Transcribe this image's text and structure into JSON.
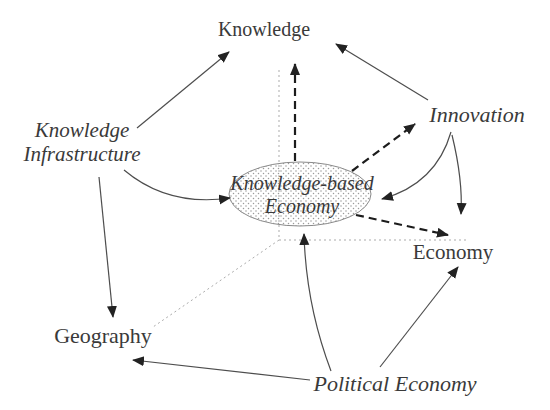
{
  "diagram": {
    "colors": {
      "background": "#ffffff",
      "text": "#3a3a3a",
      "solid_line": "#4d4d4d",
      "dashed_line": "#1c1c1c",
      "dotted_line": "#ababab",
      "arrowhead": "#222222",
      "ellipse_stroke": "#8a8a8a",
      "ellipse_dot": "#9a9a9a"
    },
    "nodes": {
      "knowledge": {
        "label": "Knowledge"
      },
      "knowledge_infrastructure": {
        "line1": "Knowledge",
        "line2": "Infrastructure"
      },
      "innovation": {
        "label": "Innovation"
      },
      "knowledge_based_economy": {
        "line1": "Knowledge-based",
        "line2": "Economy"
      },
      "economy": {
        "label": "Economy"
      },
      "geography": {
        "label": "Geography"
      },
      "political_economy": {
        "label": "Political Economy"
      }
    },
    "edges": [
      {
        "from": "knowledge_infrastructure",
        "to": "knowledge",
        "style": "solid-arrow"
      },
      {
        "from": "innovation",
        "to": "knowledge",
        "style": "solid-arrow"
      },
      {
        "from": "knowledge_infrastructure",
        "to": "knowledge_based_economy",
        "style": "solid-arrow-curved"
      },
      {
        "from": "innovation",
        "to": "knowledge_based_economy",
        "style": "solid-arrow-curved"
      },
      {
        "from": "innovation",
        "to": "economy",
        "style": "solid-arrow"
      },
      {
        "from": "knowledge_infrastructure",
        "to": "geography",
        "style": "solid-arrow"
      },
      {
        "from": "political_economy",
        "to": "knowledge_based_economy",
        "style": "solid-arrow-curved"
      },
      {
        "from": "political_economy",
        "to": "economy",
        "style": "solid-arrow"
      },
      {
        "from": "political_economy",
        "to": "geography",
        "style": "solid-arrow"
      },
      {
        "from": "knowledge_based_economy",
        "to": "knowledge",
        "style": "dashed-arrow"
      },
      {
        "from": "knowledge_based_economy",
        "to": "innovation",
        "style": "dashed-arrow"
      },
      {
        "from": "knowledge_based_economy",
        "to": "economy",
        "style": "dashed-arrow"
      },
      {
        "from": "axis-origin",
        "to": "knowledge",
        "style": "dotted-axis"
      },
      {
        "from": "axis-origin",
        "to": "economy",
        "style": "dotted-axis"
      },
      {
        "from": "axis-origin",
        "to": "geography",
        "style": "dotted-axis"
      }
    ]
  }
}
